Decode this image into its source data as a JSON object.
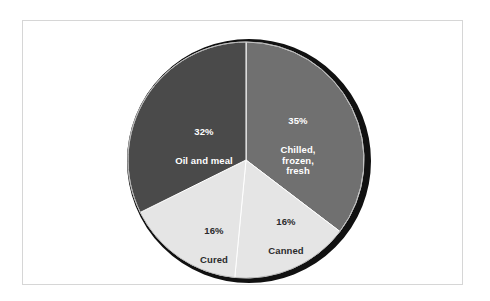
{
  "figure": {
    "background_color": "#ffffff",
    "frame_color": "#d6d6d6",
    "shadow_color": "#111111"
  },
  "chart_data": {
    "type": "pie",
    "title": "",
    "subtitle": "",
    "xlabel": "",
    "ylabel": "",
    "legend": "none",
    "grid": false,
    "start_angle_deg": 0,
    "direction": "clockwise",
    "units": "percent",
    "categories": [
      "Chilled, frozen, fresh",
      "Canned",
      "Cured",
      "Oil and meal"
    ],
    "values": [
      35,
      16,
      16,
      32
    ],
    "colors": [
      "#707070",
      "#e5e5e5",
      "#e5e5e5",
      "#4a4a4a"
    ],
    "label_colors": [
      "#ffffff",
      "#2b2b2b",
      "#2b2b2b",
      "#ffffff"
    ],
    "slices": [
      {
        "name": "Chilled, frozen, fresh",
        "percent_label": "35%",
        "value": 35,
        "color": "#707070",
        "label_color": "#ffffff",
        "name_lines": "Chilled,\nfrozen,\nfresh"
      },
      {
        "name": "Canned",
        "percent_label": "16%",
        "value": 16,
        "color": "#e5e5e5",
        "label_color": "#2b2b2b",
        "name_lines": "Canned"
      },
      {
        "name": "Cured",
        "percent_label": "16%",
        "value": 16,
        "color": "#e5e5e5",
        "label_color": "#2b2b2b",
        "name_lines": "Cured"
      },
      {
        "name": "Oil and meal",
        "percent_label": "32%",
        "value": 32,
        "color": "#4a4a4a",
        "label_color": "#ffffff",
        "name_lines": "Oil and meal"
      }
    ],
    "total": 99
  }
}
